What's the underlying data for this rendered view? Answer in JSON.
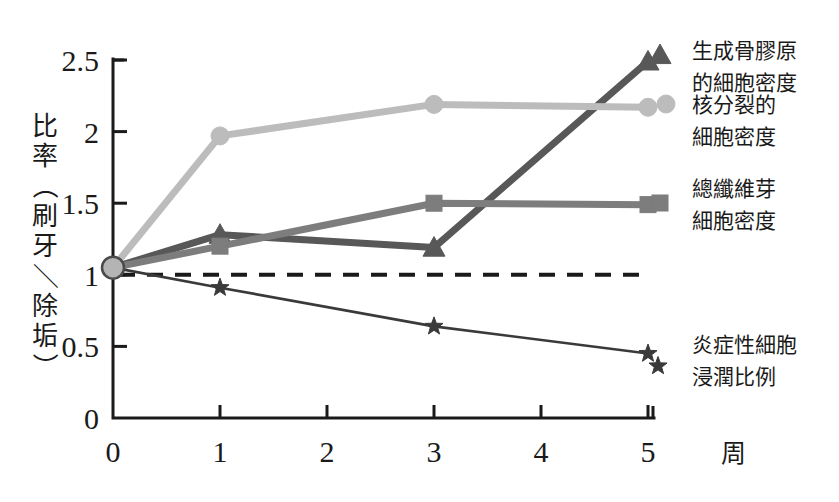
{
  "chart_data": {
    "type": "line",
    "title": "",
    "xlabel": "周",
    "ylabel": "比率（刷牙／除垢）",
    "ylabel_chars": [
      "比",
      "率",
      "（",
      "刷",
      "牙",
      "／",
      "除",
      "垢",
      "）"
    ],
    "x": [
      0,
      1,
      3,
      5
    ],
    "xticks": [
      "0",
      "1",
      "2",
      "3",
      "4",
      "5"
    ],
    "xtick_values": [
      0,
      1,
      2,
      3,
      4,
      5
    ],
    "yticks": [
      "0",
      "0.5",
      "1",
      "1.5",
      "2",
      "2.5"
    ],
    "ytick_values": [
      0,
      0.5,
      1,
      1.5,
      2,
      2.5
    ],
    "xlim": [
      0,
      5
    ],
    "ylim": [
      0,
      2.5
    ],
    "grid": false,
    "legend_position": "right",
    "reference_line": {
      "value": 1.0,
      "style": "dashed",
      "color": "#1a1a1a",
      "label": ""
    },
    "series": [
      {
        "name": "生成骨膠原的細胞密度",
        "legend_lines": [
          "生成骨膠原",
          "的細胞密度"
        ],
        "marker": "triangle",
        "color": "#585858",
        "values": [
          1.05,
          1.28,
          1.19,
          2.49
        ]
      },
      {
        "name": "核分裂的細胞密度",
        "legend_lines": [
          "核分裂的",
          "細胞密度"
        ],
        "marker": "circle",
        "color": "#bcbcbc",
        "values": [
          1.05,
          1.97,
          2.19,
          2.17
        ]
      },
      {
        "name": "總纖維芽細胞密度",
        "legend_lines": [
          "總纖維芽",
          "細胞密度"
        ],
        "marker": "square",
        "color": "#7d7d7d",
        "values": [
          1.05,
          1.2,
          1.5,
          1.49
        ]
      },
      {
        "name": "炎症性細胞浸潤比例",
        "legend_lines": [
          "炎症性細胞",
          "浸潤比例"
        ],
        "marker": "star",
        "color": "#3a3a3a",
        "values": [
          1.05,
          0.91,
          0.64,
          0.45
        ]
      }
    ]
  }
}
